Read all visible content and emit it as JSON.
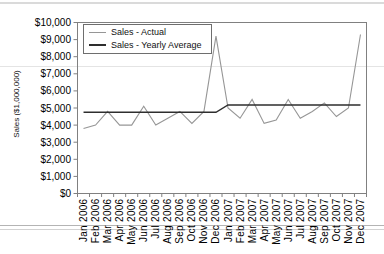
{
  "chart_data": {
    "type": "line",
    "ylabel": "Sales ($1,000,000)",
    "ylim": [
      0,
      10000
    ],
    "y_tick_step": 1000,
    "y_tick_labels": [
      "$0",
      "$1,000",
      "$2,000",
      "$3,000",
      "$4,000",
      "$5,000",
      "$6,000",
      "$7,000",
      "$8,000",
      "$9,000",
      "$10,000"
    ],
    "categories": [
      "Jan 2006",
      "Feb 2006",
      "Mar 2006",
      "Apr 2006",
      "May 2006",
      "Jun 2006",
      "Jul 2006",
      "Aug 2006",
      "Sep 2006",
      "Oct 2006",
      "Nov 2006",
      "Dec 2006",
      "Jan 2007",
      "Feb 2007",
      "Mar 2007",
      "Apr 2007",
      "May 2007",
      "Jun 2007",
      "Jul 2007",
      "Aug 2007",
      "Sep 2007",
      "Oct 2007",
      "Nov 2007",
      "Dec 2007"
    ],
    "series": [
      {
        "name": "Sales - Actual",
        "color": "#969696",
        "values": [
          3800,
          4000,
          4800,
          4000,
          4000,
          5100,
          4000,
          4400,
          4800,
          4100,
          4800,
          9200,
          5000,
          4400,
          5500,
          4100,
          4300,
          5500,
          4400,
          4800,
          5300,
          4500,
          5000,
          9300
        ]
      },
      {
        "name": "Sales - Yearly Average",
        "color": "#2e2e2e",
        "values": [
          4750,
          4750,
          4750,
          4750,
          4750,
          4750,
          4750,
          4750,
          4750,
          4750,
          4750,
          4750,
          5175,
          5175,
          5175,
          5175,
          5175,
          5175,
          5175,
          5175,
          5175,
          5175,
          5175,
          5175
        ]
      }
    ],
    "legend_position": "top-left",
    "grid": false,
    "axis_color": "#808080"
  }
}
